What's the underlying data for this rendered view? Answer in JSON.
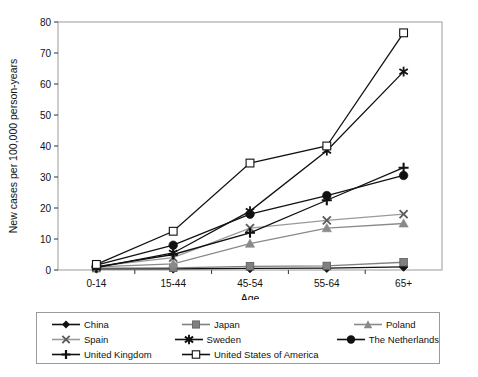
{
  "chart_data": {
    "type": "line",
    "title": "",
    "xlabel": "Age",
    "ylabel": "New cases per 100,000 person-years",
    "categories": [
      "0-14",
      "15-44",
      "45-54",
      "55-64",
      "65+"
    ],
    "ylim": [
      0,
      80
    ],
    "yticks": [
      0,
      10,
      20,
      30,
      40,
      50,
      60,
      70,
      80
    ],
    "grid": false,
    "legend_position": "bottom",
    "series": [
      {
        "name": "China",
        "marker": "filled-diamond",
        "color": "#111111",
        "values": [
          0.4,
          0.4,
          0.5,
          0.6,
          1.0
        ]
      },
      {
        "name": "Japan",
        "marker": "filled-square",
        "color": "#808080",
        "values": [
          0.6,
          0.7,
          1.2,
          1.3,
          2.5
        ]
      },
      {
        "name": "Poland",
        "marker": "filled-triangle",
        "color": "#8a8a8a",
        "values": [
          1.0,
          2.0,
          8.5,
          13.5,
          15.0
        ]
      },
      {
        "name": "Spain",
        "marker": "gray-x",
        "color": "#9a9a9a",
        "values": [
          1.2,
          4.0,
          13.5,
          16.0,
          18.0
        ]
      },
      {
        "name": "Sweden",
        "marker": "asterisk",
        "color": "#111111",
        "values": [
          0.8,
          5.5,
          19.0,
          38.5,
          64.0
        ]
      },
      {
        "name": "The Netherlands",
        "marker": "filled-circle",
        "color": "#111111",
        "values": [
          1.6,
          8.0,
          18.0,
          24.0,
          30.5
        ]
      },
      {
        "name": "United Kingdom",
        "marker": "plus",
        "color": "#111111",
        "values": [
          1.0,
          5.0,
          12.0,
          22.5,
          33.0
        ]
      },
      {
        "name": "United States of America",
        "marker": "open-square",
        "color": "#111111",
        "values": [
          1.8,
          12.5,
          34.5,
          40.0,
          76.5
        ]
      }
    ]
  },
  "legend": {
    "rows": [
      [
        "China",
        "Japan",
        "Poland"
      ],
      [
        "Spain",
        "Sweden",
        "The Netherlands"
      ],
      [
        "United Kingdom",
        "United States of America",
        ""
      ]
    ]
  }
}
